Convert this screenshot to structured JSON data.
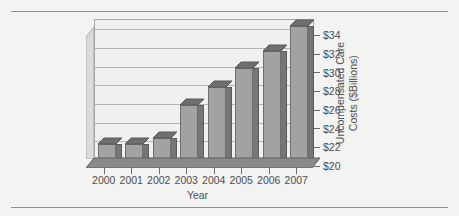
{
  "figure": {
    "clipped_title": "",
    "x_axis_title": "Year",
    "y_axis_title_line1": "Uncompensated Care",
    "y_axis_title_line2": "Costs ($Billions)"
  },
  "colors": {
    "page_background": "#f3f3f2",
    "plot_background": "#f0f0ef",
    "bar_front": "#a2a2a2",
    "bar_side": "#767676",
    "bar_top": "#6f6f6f",
    "gridline": "#b4b4b4",
    "axis_line": "#6a6a6a",
    "rule": "#8d8d8d",
    "text": "#4d4d4d",
    "floor": "#8a8a8a"
  },
  "chart_data": {
    "type": "bar",
    "title": "",
    "xlabel": "Year",
    "ylabel": "Uncompensated Care Costs ($Billions)",
    "categories": [
      "2000",
      "2001",
      "2002",
      "2003",
      "2004",
      "2005",
      "2006",
      "2007"
    ],
    "values": [
      21.6,
      21.6,
      22.3,
      25.8,
      27.7,
      29.8,
      31.6,
      34.2
    ],
    "ylim": [
      20,
      35
    ],
    "yticks": [
      20,
      22,
      24,
      26,
      28,
      30,
      32,
      34
    ],
    "ytick_labels": [
      "$20",
      "$22",
      "$24",
      "$26",
      "$28",
      "$30",
      "$32",
      "$34"
    ],
    "grid": true,
    "grid_axis": "y",
    "legend": false,
    "three_d": true,
    "series": [
      {
        "name": "Uncompensated Care Costs",
        "values": [
          21.6,
          21.6,
          22.3,
          25.8,
          27.7,
          29.8,
          31.6,
          34.2
        ]
      }
    ]
  }
}
